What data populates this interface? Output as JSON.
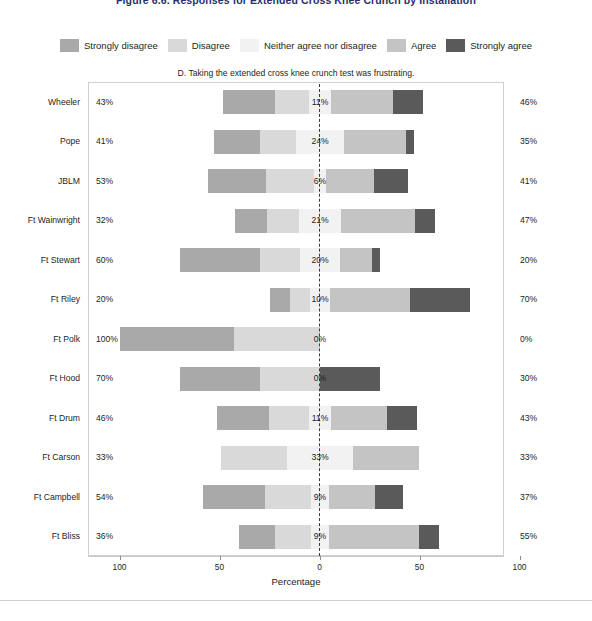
{
  "figure": {
    "title": "Figure 6.6. Responses for Extended Cross Knee Crunch by Installation"
  },
  "legend": {
    "position": "top",
    "items": [
      {
        "label": "Strongly disagree",
        "color": "#a9a9a9"
      },
      {
        "label": "Disagree",
        "color": "#d9d9d9"
      },
      {
        "label": "Neither agree nor disagree",
        "color": "#f2f2f2"
      },
      {
        "label": "Agree",
        "color": "#c4c4c4"
      },
      {
        "label": "Strongly agree",
        "color": "#5a5a5a"
      }
    ]
  },
  "axis": {
    "xlabel": "Percentage",
    "ticks": [
      "100",
      "50",
      "0",
      "50",
      "100"
    ]
  },
  "chart_data": {
    "type": "bar",
    "title": "D. Taking the extended cross knee crunch test was frustrating.",
    "xlabel": "Percentage",
    "ylabel": "",
    "xlim": [
      -100,
      100
    ],
    "grid": false,
    "legend_position": "top",
    "orientation": "horizontal-diverging",
    "categories": [
      "Wheeler",
      "Pope",
      "JBLM",
      "Ft Wainwright",
      "Ft Stewart",
      "Ft Riley",
      "Ft Polk",
      "Ft Hood",
      "Ft Drum",
      "Ft Carson",
      "Ft Campbell",
      "Ft Bliss"
    ],
    "series": [
      {
        "name": "Strongly disagree",
        "color": "#a9a9a9",
        "values": [
          26,
          23,
          29,
          16,
          40,
          10,
          57,
          40,
          26,
          0,
          31,
          18
        ]
      },
      {
        "name": "Disagree",
        "color": "#d9d9d9",
        "values": [
          17,
          18,
          24,
          16,
          20,
          10,
          43,
          30,
          20,
          33,
          23,
          18
        ]
      },
      {
        "name": "Neither agree nor disagree",
        "color": "#f2f2f2",
        "values": [
          11,
          24,
          6,
          21,
          20,
          10,
          0,
          0,
          11,
          33,
          9,
          9
        ]
      },
      {
        "name": "Agree",
        "color": "#c4c4c4",
        "values": [
          31,
          31,
          24,
          37,
          16,
          40,
          0,
          0,
          28,
          33,
          23,
          45
        ]
      },
      {
        "name": "Strongly agree",
        "color": "#5a5a5a",
        "values": [
          15,
          4,
          17,
          10,
          4,
          30,
          0,
          30,
          15,
          0,
          14,
          10
        ]
      }
    ],
    "labels": {
      "left_total": [
        "43%",
        "41%",
        "53%",
        "32%",
        "60%",
        "20%",
        "100%",
        "70%",
        "46%",
        "33%",
        "54%",
        "36%"
      ],
      "center_neutral": [
        "11%",
        "24%",
        "6%",
        "21%",
        "20%",
        "10%",
        "0%",
        "0%",
        "11%",
        "33%",
        "9%",
        "9%"
      ],
      "right_total": [
        "46%",
        "35%",
        "41%",
        "47%",
        "20%",
        "70%",
        "0%",
        "30%",
        "43%",
        "33%",
        "37%",
        "55%"
      ]
    }
  }
}
